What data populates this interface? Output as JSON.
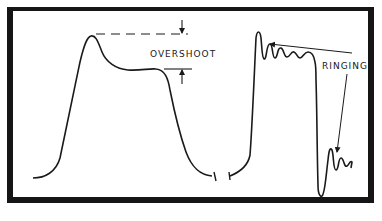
{
  "figure": {
    "type": "waveform-diagram",
    "frame_color": "#151515",
    "background_color": "#ffffff",
    "stroke_color": "#1a1a1a"
  },
  "labels": {
    "overshoot": "OVERSHOOT",
    "ringing": "RINGING"
  },
  "waveforms": [
    {
      "name": "overshoot-pulse",
      "description": "Pulse with overshoot peak above the flat top, followed by falling edge"
    },
    {
      "name": "ringing-pulse",
      "description": "Pulse with damped ringing oscillations after rising and falling edges"
    }
  ]
}
